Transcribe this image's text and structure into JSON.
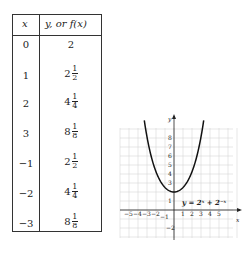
{
  "table": {
    "headers": {
      "x": "x",
      "y": "y, or f(x)"
    },
    "rows": [
      {
        "x": "0",
        "whole": "2",
        "num": "",
        "den": ""
      },
      {
        "x": "1",
        "whole": "2",
        "num": "1",
        "den": "2"
      },
      {
        "x": "2",
        "whole": "4",
        "num": "1",
        "den": "4"
      },
      {
        "x": "3",
        "whole": "8",
        "num": "1",
        "den": "8"
      },
      {
        "x": "−1",
        "whole": "2",
        "num": "1",
        "den": "2"
      },
      {
        "x": "−2",
        "whole": "4",
        "num": "1",
        "den": "4"
      },
      {
        "x": "−3",
        "whole": "8",
        "num": "1",
        "den": "8"
      }
    ]
  },
  "graph": {
    "equation": "y = 2ˣ + 2⁻ˣ",
    "x_axis_label": "x",
    "y_axis_label": "y",
    "x_ticks": [
      "−5",
      "−4",
      "−3",
      "−2",
      "−1",
      "1",
      "2",
      "3",
      "4",
      "5"
    ],
    "y_ticks": [
      "1",
      "2",
      "3",
      "4",
      "5",
      "6",
      "7",
      "8",
      "−1",
      "−2"
    ]
  },
  "chart_data": {
    "type": "line",
    "title": "",
    "equation": "y = 2^x + 2^-x",
    "xlabel": "x",
    "ylabel": "y",
    "xlim": [
      -5,
      6
    ],
    "ylim": [
      -3,
      9
    ],
    "grid": true,
    "table": {
      "columns": [
        "x",
        "y, or f(x)"
      ],
      "rows": [
        [
          "0",
          "2"
        ],
        [
          "1",
          "2 1/2"
        ],
        [
          "2",
          "4 1/4"
        ],
        [
          "3",
          "8 1/8"
        ],
        [
          "-1",
          "2 1/2"
        ],
        [
          "-2",
          "4 1/4"
        ],
        [
          "-3",
          "8 1/8"
        ]
      ]
    },
    "series": [
      {
        "name": "y = 2^x + 2^-x",
        "x": [
          -3,
          -2,
          -1,
          0,
          1,
          2,
          3
        ],
        "y": [
          8.125,
          4.25,
          2.5,
          2,
          2.5,
          4.25,
          8.125
        ]
      }
    ]
  }
}
